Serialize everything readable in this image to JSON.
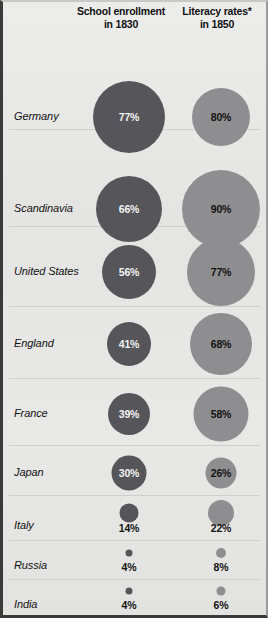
{
  "header": {
    "col1_line1": "School enrollment",
    "col1_line2": "in 1830",
    "col2_line1": "Literacy rates*",
    "col2_line2": "in 1850"
  },
  "colors": {
    "enrollment_bubble": "#56565a",
    "literacy_bubble": "#8e8e90",
    "background": "#e6e6e4",
    "rule": "#cfcfcd",
    "text": "#111111",
    "text_on_dark": "#f2f2f2"
  },
  "chart_data": {
    "type": "bubble",
    "title": "",
    "xlabel": "",
    "ylabel": "",
    "categories": [
      "Germany",
      "Scandinavia",
      "United States",
      "England",
      "France",
      "Japan",
      "Italy",
      "Russia",
      "India"
    ],
    "series": [
      {
        "name": "School enrollment in 1830",
        "unit": "%",
        "color": "#56565a",
        "values": [
          77,
          66,
          56,
          41,
          39,
          30,
          14,
          4,
          4
        ],
        "labels": [
          "77%",
          "66%",
          "56%",
          "41%",
          "39%",
          "30%",
          "14%",
          "4%",
          "4%"
        ]
      },
      {
        "name": "Literacy rates* in 1850",
        "unit": "%",
        "color": "#8e8e90",
        "values": [
          80,
          90,
          77,
          68,
          58,
          26,
          22,
          8,
          6
        ],
        "labels": [
          "80%",
          "90%",
          "77%",
          "68%",
          "58%",
          "26%",
          "22%",
          "8%",
          "6%"
        ]
      }
    ],
    "encoding": "circle area proportional to value",
    "legend": "none",
    "grid": "horizontal row separators"
  },
  "rows": [
    {
      "label": "Germany",
      "top": 34,
      "height": 94,
      "label_y": 81,
      "rule": true,
      "enrollment": {
        "value": "77%",
        "d": 72,
        "cy": 81,
        "inside": true
      },
      "literacy": {
        "value": "80%",
        "d": 58,
        "cy": 81,
        "inside": true
      }
    },
    {
      "label": "Scandinavia",
      "top": 128,
      "height": 97,
      "label_y": 79,
      "rule": true,
      "enrollment": {
        "value": "66%",
        "d": 66,
        "cy": 79,
        "inside": true
      },
      "literacy": {
        "value": "90%",
        "d": 78,
        "cy": 79,
        "inside": true
      }
    },
    {
      "label": "United States",
      "top": 225,
      "height": 80,
      "label_y": 45,
      "rule": true,
      "enrollment": {
        "value": "56%",
        "d": 54,
        "cy": 45,
        "inside": true
      },
      "literacy": {
        "value": "77%",
        "d": 68,
        "cy": 45,
        "inside": true
      }
    },
    {
      "label": "England",
      "top": 305,
      "height": 72,
      "label_y": 37,
      "rule": true,
      "enrollment": {
        "value": "41%",
        "d": 44,
        "cy": 37,
        "inside": true
      },
      "literacy": {
        "value": "68%",
        "d": 62,
        "cy": 37,
        "inside": true
      }
    },
    {
      "label": "France",
      "top": 377,
      "height": 67,
      "label_y": 35,
      "rule": true,
      "enrollment": {
        "value": "39%",
        "d": 42,
        "cy": 35,
        "inside": true
      },
      "literacy": {
        "value": "58%",
        "d": 55,
        "cy": 35,
        "inside": true
      }
    },
    {
      "label": "Japan",
      "top": 444,
      "height": 50,
      "label_y": 27,
      "rule": true,
      "enrollment": {
        "value": "30%",
        "d": 35,
        "cy": 27,
        "inside": true
      },
      "literacy": {
        "value": "26%",
        "d": 31,
        "cy": 27,
        "inside": true
      }
    },
    {
      "label": "Italy",
      "top": 494,
      "height": 45,
      "label_y": 30,
      "rule": true,
      "enrollment": {
        "value": "14%",
        "d": 19,
        "cy": 17,
        "inside": false,
        "text_y": 32
      },
      "literacy": {
        "value": "22%",
        "d": 26,
        "cy": 17,
        "inside": false,
        "text_y": 32
      }
    },
    {
      "label": "Russia",
      "top": 539,
      "height": 39,
      "label_y": 25,
      "rule": true,
      "enrollment": {
        "value": "4%",
        "d": 7,
        "cy": 12,
        "inside": false,
        "text_y": 26
      },
      "literacy": {
        "value": "8%",
        "d": 10,
        "cy": 12,
        "inside": false,
        "text_y": 26
      }
    },
    {
      "label": "India",
      "top": 578,
      "height": 37,
      "label_y": 25,
      "rule": false,
      "enrollment": {
        "value": "4%",
        "d": 7,
        "cy": 11,
        "inside": false,
        "text_y": 25
      },
      "literacy": {
        "value": "6%",
        "d": 9,
        "cy": 11,
        "inside": false,
        "text_y": 25
      }
    }
  ],
  "layout": {
    "enrollment_cx": 126,
    "literacy_cx": 218
  }
}
